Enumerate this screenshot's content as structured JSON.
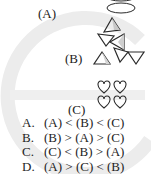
{
  "question": {
    "figures": [
      {
        "label": "(A)",
        "shape": "ellipse",
        "count": 2
      },
      {
        "label": "(B)",
        "shape": "triangle",
        "count": 7
      },
      {
        "label": "(C)",
        "shape": "heart",
        "count": 4
      }
    ],
    "options": [
      {
        "key": "A.",
        "text": "(A) < (B) < (C)"
      },
      {
        "key": "B.",
        "text": "(B) > (A) > (C)"
      },
      {
        "key": "C.",
        "text": "(C) < (B) > (A)"
      },
      {
        "key": "D.",
        "text": "(A) > (C) < (B)"
      }
    ]
  },
  "colors": {
    "text": "#1e1e1e",
    "shape_stroke": "#2a2a2a",
    "watermark": "#e6e6e6"
  }
}
